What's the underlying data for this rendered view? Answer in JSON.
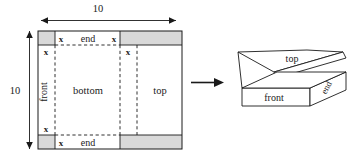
{
  "figure": {
    "caption_absent": true,
    "dimensions": {
      "top_label": "10",
      "left_label": "10"
    },
    "sheet": {
      "region_labels": {
        "bottom": "bottom",
        "top": "top",
        "front": "front",
        "end_top": "end",
        "end_bottom": "end"
      },
      "cut_labels": {
        "top_left_x": "x",
        "top_right_x": "x",
        "upper_left_x": "x",
        "upper_right_x": "x",
        "lower_left_x": "x",
        "bottom_left_x": "x"
      },
      "shading_color": "#d9d9d9",
      "stroke_color": "#1a1a1a"
    },
    "arrow": {
      "name": "transform-arrow",
      "direction": "right"
    },
    "box": {
      "face_labels": {
        "top": "top",
        "front": "front",
        "end": "end"
      },
      "fill_color": "#ffffff",
      "stroke_color": "#1a1a1a"
    }
  }
}
